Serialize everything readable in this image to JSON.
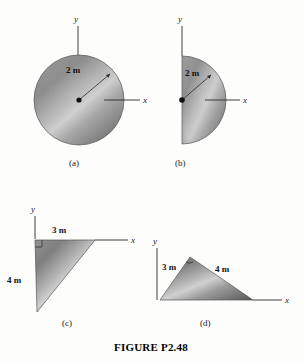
{
  "figure": {
    "caption": "FIGURE P2.48",
    "background_color": "#fdfdfb",
    "shape_fill_dark": "#6f6f6f",
    "shape_fill_light": "#d8d8d8",
    "outline_color": "#555555",
    "axis_color": "#2b2b2b"
  },
  "parts": [
    {
      "key": "a",
      "label": "(a)",
      "shape_name": "full-circle",
      "axis_y_label": "y",
      "axis_x_label": "x",
      "dimension_label": "2 m",
      "dimension_value": 2,
      "dimension_unit": "m",
      "dimension_meaning": "radius"
    },
    {
      "key": "b",
      "label": "(b)",
      "shape_name": "semicircle",
      "axis_y_label": "y",
      "axis_x_label": "x",
      "dimension_label": "2 m",
      "dimension_value": 2,
      "dimension_unit": "m",
      "dimension_meaning": "radius"
    },
    {
      "key": "c",
      "label": "(c)",
      "shape_name": "right-triangle-down",
      "axis_y_label": "y",
      "axis_x_label": "x",
      "dimension_label_top": "3 m",
      "dimension_label_side": "4 m",
      "base_value": 3,
      "height_value": 4,
      "dimension_unit": "m"
    },
    {
      "key": "d",
      "label": "(d)",
      "shape_name": "right-triangle-right",
      "axis_y_label": "y",
      "axis_x_label": "x",
      "dimension_label_side": "3 m",
      "dimension_label_hyp": "4 m",
      "side_value": 3,
      "hyp_value": 4,
      "dimension_unit": "m"
    }
  ]
}
